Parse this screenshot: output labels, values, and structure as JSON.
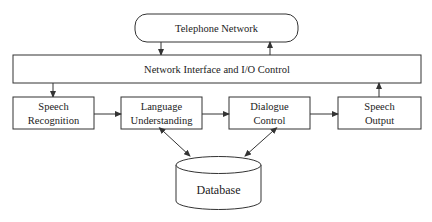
{
  "diagram": {
    "telephone_network": "Telephone Network",
    "network_interface": "Network Interface and I/O Control",
    "modules": [
      {
        "line1": "Speech",
        "line2": "Recognition"
      },
      {
        "line1": "Language",
        "line2": "Understanding"
      },
      {
        "line1": "Dialogue",
        "line2": "Control"
      },
      {
        "line1": "Speech",
        "line2": "Output"
      }
    ],
    "database": "Database",
    "connections": [
      {
        "from": "Telephone Network",
        "to": "Network Interface and I/O Control"
      },
      {
        "from": "Network Interface and I/O Control",
        "to": "Telephone Network"
      },
      {
        "from": "Network Interface and I/O Control",
        "to": "Speech Recognition"
      },
      {
        "from": "Speech Recognition",
        "to": "Language Understanding"
      },
      {
        "from": "Language Understanding",
        "to": "Dialogue Control"
      },
      {
        "from": "Dialogue Control",
        "to": "Speech Output"
      },
      {
        "from": "Speech Output",
        "to": "Network Interface and I/O Control"
      },
      {
        "from": "Language Understanding",
        "to": "Database",
        "bidirectional": true
      },
      {
        "from": "Dialogue Control",
        "to": "Database",
        "bidirectional": true
      }
    ]
  }
}
